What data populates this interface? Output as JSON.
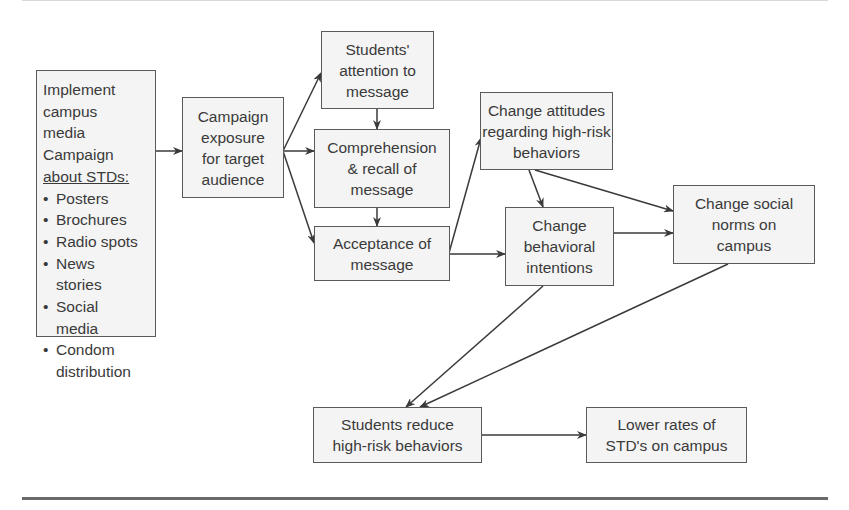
{
  "diagram": {
    "type": "flowchart",
    "nodes": {
      "implement": {
        "lines": [
          "Implement",
          "campus",
          "media",
          "Campaign"
        ],
        "heading": "about STDs:",
        "bullets": [
          {
            "bullet": "•",
            "lines": [
              "Posters"
            ]
          },
          {
            "bullet": "•",
            "lines": [
              "Brochures"
            ]
          },
          {
            "bullet": "•",
            "lines": [
              "Radio spots"
            ]
          },
          {
            "bullet": "•",
            "lines": [
              "News",
              "stories"
            ]
          },
          {
            "bullet": "•",
            "lines": [
              "Social",
              "media"
            ]
          },
          {
            "bullet": "•",
            "lines": [
              "Condom",
              "distribution"
            ]
          }
        ]
      },
      "exposure": {
        "lines": [
          "Campaign",
          "exposure",
          "for target",
          "audience"
        ]
      },
      "attention": {
        "lines": [
          "Students'",
          "attention to",
          "message"
        ]
      },
      "comprehension": {
        "lines": [
          "Comprehension",
          "& recall of",
          "message"
        ]
      },
      "acceptance": {
        "lines": [
          "Acceptance of",
          "message"
        ]
      },
      "attitudes": {
        "lines": [
          "Change attitudes",
          "regarding high-risk",
          "behaviors"
        ]
      },
      "intentions": {
        "lines": [
          "Change",
          "behavioral",
          "intentions"
        ]
      },
      "norms": {
        "lines": [
          "Change social",
          "norms on",
          "campus"
        ]
      },
      "reduce": {
        "lines": [
          "Students reduce",
          "high-risk behaviors"
        ]
      },
      "lower": {
        "lines": [
          "Lower rates of",
          "STD's on campus"
        ]
      }
    },
    "edges": [
      {
        "from": "implement",
        "to": "exposure"
      },
      {
        "from": "exposure",
        "to": "attention"
      },
      {
        "from": "exposure",
        "to": "comprehension"
      },
      {
        "from": "exposure",
        "to": "acceptance"
      },
      {
        "from": "attention",
        "to": "comprehension"
      },
      {
        "from": "comprehension",
        "to": "acceptance"
      },
      {
        "from": "acceptance",
        "to": "attitudes"
      },
      {
        "from": "acceptance",
        "to": "intentions"
      },
      {
        "from": "attitudes",
        "to": "intentions"
      },
      {
        "from": "attitudes",
        "to": "norms"
      },
      {
        "from": "intentions",
        "to": "norms"
      },
      {
        "from": "intentions",
        "to": "reduce"
      },
      {
        "from": "norms",
        "to": "reduce"
      },
      {
        "from": "reduce",
        "to": "lower"
      }
    ],
    "colors": {
      "line": "#3a3a3a",
      "box_border": "#5a5a5a",
      "box_fill": "#f4f4f4",
      "text": "#3a3a3a"
    }
  }
}
